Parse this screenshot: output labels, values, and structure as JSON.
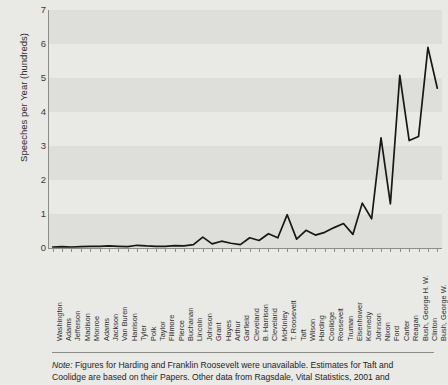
{
  "chart_data": {
    "type": "line",
    "title": "",
    "xlabel": "",
    "ylabel": "Speeches per Year (hundreds)",
    "ylim": [
      0,
      7
    ],
    "yticks": [
      0,
      1,
      2,
      3,
      4,
      5,
      6,
      7
    ],
    "grid": "alternating horizontal bands",
    "legend": "none",
    "categories": [
      "Washington",
      "Adams",
      "Jefferson",
      "Madison",
      "Monroe",
      "Adams",
      "Jackson",
      "Van Buren",
      "Harrison",
      "Tyler",
      "Polk",
      "Taylor",
      "Fillmore",
      "Pierce",
      "Buchanan",
      "Lincoln",
      "Johnson",
      "Grant",
      "Hayes",
      "Arthur",
      "Garfield",
      "Cleveland",
      "B. Harrison",
      "Cleveland",
      "McKinley",
      "T. Roosevelt",
      "Taft",
      "Wilson",
      "Harding",
      "Coolidge",
      "Roosevelt",
      "Truman",
      "Eisenhower",
      "Kennedy",
      "Johnson",
      "Nixon",
      "Ford",
      "Carter",
      "Reagan",
      "Bush, George H. W.",
      "Clinton",
      "Bush, George W."
    ],
    "values": [
      0.03,
      0.04,
      0.03,
      0.04,
      0.05,
      0.05,
      0.06,
      0.05,
      0.04,
      0.08,
      0.06,
      0.05,
      0.05,
      0.07,
      0.06,
      0.1,
      0.32,
      0.12,
      0.2,
      0.14,
      0.1,
      0.3,
      0.22,
      0.42,
      0.3,
      0.98,
      0.26,
      0.52,
      0.38,
      0.46,
      0.6,
      0.72,
      0.4,
      1.32,
      0.86,
      3.24,
      1.3,
      5.08,
      3.16,
      3.28,
      5.9,
      4.7
    ],
    "series_color": "#171717"
  },
  "note": {
    "label": "Note:",
    "line1": "Figures for Harding and Franklin Roosevelt were unavailable. Estimates for Taft and",
    "line2": "Coolidge are based on their Papers. Other data from Ragsdale, Vital Statistics, 2001 and"
  }
}
